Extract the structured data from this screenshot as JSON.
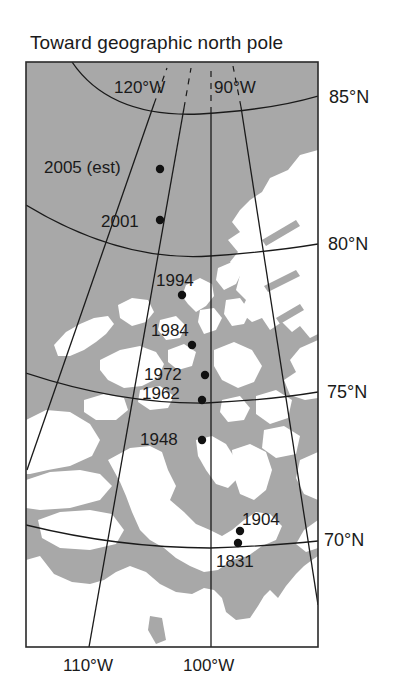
{
  "title": "Toward geographic north pole",
  "colors": {
    "ocean": "#a8a8a8",
    "land": "#ffffff",
    "lines": "#1a1a1a"
  },
  "longitude_labels": {
    "w120": "120°W",
    "w90": "90°W",
    "w110": "110°W",
    "w100": "100°W"
  },
  "latitude_labels": {
    "n85": "85°N",
    "n80": "80°N",
    "n75": "75°N",
    "n70": "70°N"
  },
  "pole_positions": [
    {
      "year": "2005 (est)"
    },
    {
      "year": "2001"
    },
    {
      "year": "1994"
    },
    {
      "year": "1984"
    },
    {
      "year": "1972"
    },
    {
      "year": "1962"
    },
    {
      "year": "1948"
    },
    {
      "year": "1904"
    },
    {
      "year": "1831"
    }
  ]
}
